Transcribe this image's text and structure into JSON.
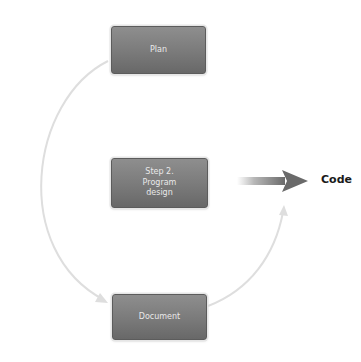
{
  "diagram": {
    "type": "cycle-flow",
    "nodes": [
      {
        "id": "plan",
        "label": "Plan"
      },
      {
        "id": "program-design",
        "label": "Step 2.\nProgram\ndesign"
      },
      {
        "id": "document",
        "label": "Document"
      }
    ],
    "output": {
      "label": "Code"
    },
    "edges": [
      {
        "from": "plan",
        "to": "document",
        "style": "light-gray curved arrow (left arc)"
      },
      {
        "from": "document",
        "to": "output",
        "style": "light-gray curved arrow (right arc)"
      },
      {
        "from": "program-design",
        "to": "output",
        "style": "bold gray gradient arrow"
      }
    ],
    "colors": {
      "node_fill_top": "#8e8e8e",
      "node_fill_bottom": "#686868",
      "node_text": "#e9e9e9",
      "connector": "#dcdcdc",
      "main_arrow": "#6f6f6f",
      "output_text": "#1a1a1a"
    }
  }
}
